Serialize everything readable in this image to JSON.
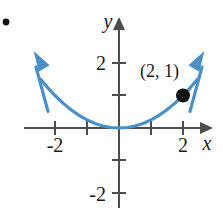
{
  "figure": {
    "name": "parabola-graph",
    "bullet_marker": "•",
    "colors": {
      "curve": "#4a90c8",
      "axis": "#4d4d4d",
      "text": "#1a1a1a",
      "point": "#111111",
      "background": "#ffffff"
    },
    "axes": {
      "x": {
        "label": "x",
        "tick_labels": [
          "-2",
          "2"
        ],
        "ticks": [
          -2,
          -1,
          1,
          2
        ],
        "range": [
          -2.7,
          2.6
        ],
        "arrow": "right"
      },
      "y": {
        "label": "y",
        "tick_labels": [
          "2",
          "-2"
        ],
        "ticks": [
          2,
          1,
          -1,
          -2
        ],
        "range": [
          -2.6,
          2.6
        ],
        "arrow": "up"
      }
    },
    "annotation": {
      "text": "(2, 1)",
      "points_to": {
        "x": 2,
        "y": 1
      }
    }
  },
  "chart_data": {
    "type": "line",
    "title": "",
    "xlabel": "x",
    "ylabel": "y",
    "xlim": [
      -2.7,
      2.6
    ],
    "ylim": [
      -2.6,
      2.6
    ],
    "grid": false,
    "legend": "none",
    "xticks": [
      -2,
      -1,
      1,
      2
    ],
    "xticklabels": [
      "-2",
      "",
      "",
      "2"
    ],
    "yticks": [
      -2,
      -1,
      1,
      2
    ],
    "yticklabels": [
      "-2",
      "",
      "",
      "2"
    ],
    "series": [
      {
        "name": "y = x^2/4",
        "equation": "y = 0.25 x^2",
        "color": "#4a90c8",
        "arrows": [
          "start",
          "end"
        ],
        "x": [
          -2.45,
          -2.2,
          -2.0,
          -1.75,
          -1.5,
          -1.25,
          -1.0,
          -0.75,
          -0.5,
          -0.25,
          0,
          0.25,
          0.5,
          0.75,
          1.0,
          1.25,
          1.5,
          1.75,
          2.0,
          2.2,
          2.45
        ],
        "y": [
          1.5,
          1.21,
          1.0,
          0.766,
          0.5625,
          0.39,
          0.25,
          0.14,
          0.0625,
          0.0156,
          0,
          0.0156,
          0.0625,
          0.14,
          0.25,
          0.39,
          0.5625,
          0.766,
          1.0,
          1.21,
          1.5
        ]
      }
    ],
    "annotations": [
      {
        "label": "(2, 1)",
        "x": 2,
        "y": 1,
        "marker": "filled-circle",
        "marker_color": "#111111"
      }
    ]
  }
}
